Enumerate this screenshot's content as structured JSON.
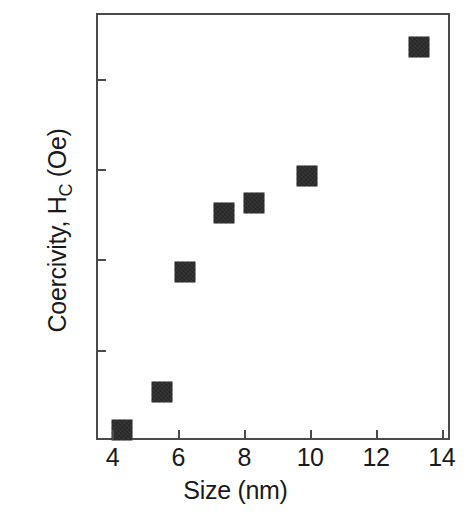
{
  "chart_data": {
    "type": "scatter",
    "title": "",
    "xlabel": "Size (nm)",
    "ylabel_main": "Coercivity, H",
    "ylabel_sub": "C",
    "ylabel_unit": " (Oe)",
    "ylabel_full": "Coercivity, HC (Oe)",
    "xlim": [
      3.5,
      14.25
    ],
    "ylim": [
      0,
      473
    ],
    "xticks": [
      4,
      6,
      8,
      10,
      12,
      14
    ],
    "xtick_labels": [
      "4",
      "6",
      "8",
      "10",
      "12",
      "14"
    ],
    "yticks": [
      100,
      200,
      300,
      400
    ],
    "ytick_labels": [
      "100",
      "200",
      "300",
      "400"
    ],
    "grid": false,
    "legend": null,
    "marker": "filled-square",
    "marker_color": "#2b2b2b",
    "axis_color": "#4a4a4a",
    "points": [
      {
        "x": 4.3,
        "y": 11,
        "label": "4.3 nm, 11 Oe"
      },
      {
        "x": 5.5,
        "y": 53,
        "label": "5.5 nm, 53 Oe"
      },
      {
        "x": 6.2,
        "y": 186,
        "label": "6.2 nm, 186 Oe"
      },
      {
        "x": 7.4,
        "y": 252,
        "label": "7.4 nm, 252 Oe"
      },
      {
        "x": 8.3,
        "y": 263,
        "label": "8.3 nm, 263 Oe"
      },
      {
        "x": 9.9,
        "y": 292,
        "label": "9.9 nm, 292 Oe"
      },
      {
        "x": 13.3,
        "y": 435,
        "label": "13.3 nm, 435 Oe"
      }
    ]
  }
}
